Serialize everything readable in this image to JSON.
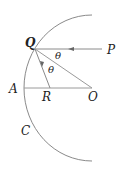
{
  "diagram": {
    "type": "concave mirror ray diagram",
    "labels": {
      "Q": "Q",
      "P": "P",
      "A": "A",
      "R": "R",
      "O": "O",
      "C": "C",
      "theta_incident": "θ",
      "theta_reflected": "θ"
    },
    "colors": {
      "line": "#8a8a8a",
      "text": "#222222",
      "background": "#ffffff"
    }
  }
}
